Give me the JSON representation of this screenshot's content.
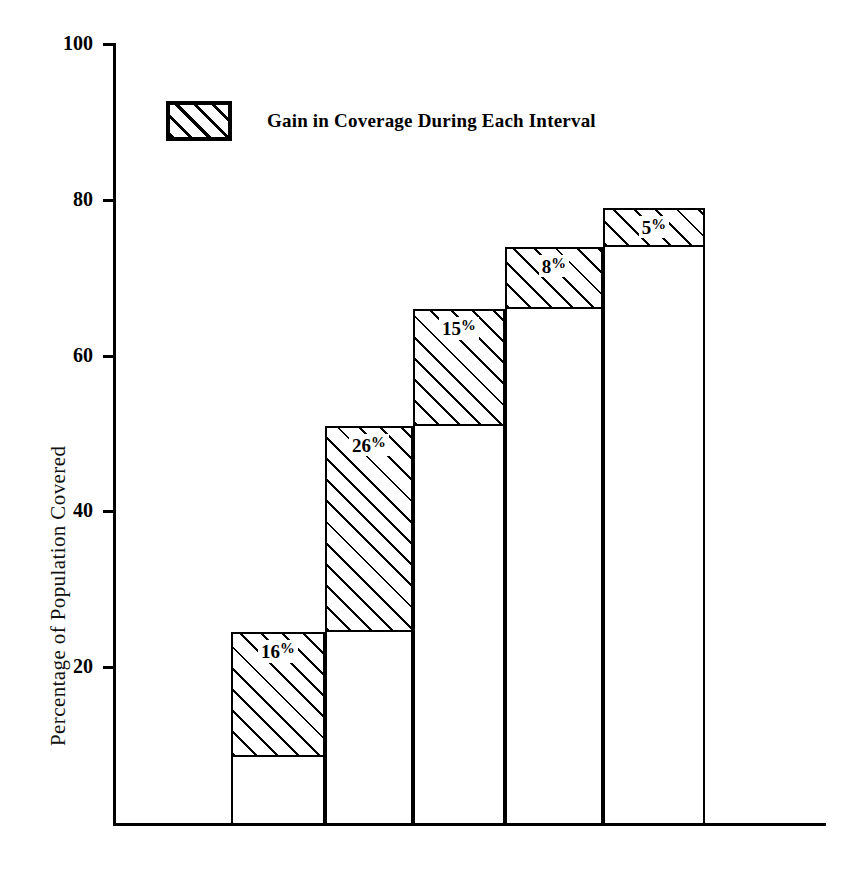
{
  "chart_data": {
    "type": "bar",
    "title": "",
    "subtitle": "",
    "xlabel": "",
    "ylabel": "Percentage of Population Covered",
    "categories": [
      "1940-45",
      "1945-50",
      "1950-55",
      "1955-60",
      "1960-64"
    ],
    "ylim": [
      0,
      100
    ],
    "yticks": [
      20,
      40,
      60,
      80,
      100
    ],
    "ytick_labels": [
      "20",
      "40",
      "60",
      "80",
      "100"
    ],
    "grid": false,
    "legend_position": "inside-top-left",
    "legend_entries": [
      {
        "label": "Gain in Coverage During Each Interval",
        "pattern": "diagonal-hatch"
      }
    ],
    "series": [
      {
        "name": "Coverage at start of interval",
        "values": [
          8.5,
          24.5,
          51,
          66,
          74
        ]
      },
      {
        "name": "Gain in Coverage During Each Interval",
        "values": [
          16,
          26,
          15,
          8,
          5
        ]
      },
      {
        "name": "Coverage at end of interval",
        "values": [
          24.5,
          51,
          66,
          74,
          79
        ]
      }
    ],
    "bars": [
      {
        "category": "1940-45",
        "base": 8.5,
        "top": 24.5,
        "gain": 16,
        "gain_label": "16",
        "gain_label_suffix": "%"
      },
      {
        "category": "1945-50",
        "base": 24.5,
        "top": 51,
        "gain": 26,
        "gain_label": "26",
        "gain_label_suffix": "%"
      },
      {
        "category": "1950-55",
        "base": 51,
        "top": 66,
        "gain": 15,
        "gain_label": "15",
        "gain_label_suffix": "%"
      },
      {
        "category": "1955-60",
        "base": 66,
        "top": 74,
        "gain": 8,
        "gain_label": "8",
        "gain_label_suffix": "%"
      },
      {
        "category": "1960-64",
        "base": 74,
        "top": 79,
        "gain": 5,
        "gain_label": "5",
        "gain_label_suffix": "%"
      }
    ],
    "colors": {
      "ink": "#000000",
      "background": "#ffffff",
      "bar_fill": "#ffffff",
      "hatch": "#000000"
    }
  }
}
